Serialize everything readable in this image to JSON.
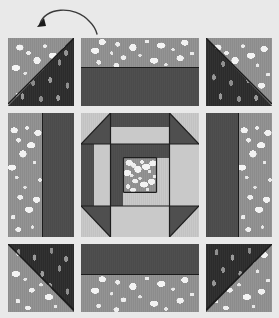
{
  "diagram": {
    "type": "quilt-block-layout",
    "grid": {
      "rows": 3,
      "cols": 3
    },
    "annotation": {
      "name": "rotation-arrow",
      "shape": "curved-arc-arrow",
      "direction": "counter-clockwise",
      "points_to": "top-left-unit"
    },
    "colors": {
      "background": "#e9e9e9",
      "speckled_gray": "#949494",
      "speckle_dots": "#f2f2f2",
      "dark_leaf_print": "#2b2b2b",
      "leaf_motif": "#949494",
      "solid_dark_gray": "#4f4f4f",
      "light_gray": "#c9c9c9",
      "seam_line": "#1e1e1e",
      "unit_border": "#8d8d8d"
    },
    "units": [
      {
        "name": "top-left-unit",
        "pattern": "half-square-triangle",
        "fabrics": [
          "speckled_gray",
          "dark_leaf_print"
        ],
        "dark_corner": "bottom-right"
      },
      {
        "name": "top-center-unit",
        "pattern": "two-band-horizontal",
        "fabrics": [
          "speckled_gray",
          "solid_dark_gray"
        ],
        "dark_band": "bottom"
      },
      {
        "name": "top-right-unit",
        "pattern": "half-square-triangle",
        "fabrics": [
          "speckled_gray",
          "dark_leaf_print"
        ],
        "dark_corner": "bottom-left"
      },
      {
        "name": "middle-left-unit",
        "pattern": "two-band-vertical",
        "fabrics": [
          "speckled_gray",
          "solid_dark_gray"
        ],
        "dark_band": "right"
      },
      {
        "name": "center-unit",
        "pattern": "churn-dash-octagon",
        "fabrics": [
          "light_gray",
          "solid_dark_gray",
          "speckled_gray"
        ],
        "dark_corner": "none"
      },
      {
        "name": "middle-right-unit",
        "pattern": "two-band-vertical",
        "fabrics": [
          "speckled_gray",
          "solid_dark_gray"
        ],
        "dark_band": "left"
      },
      {
        "name": "bottom-left-unit",
        "pattern": "half-square-triangle",
        "fabrics": [
          "speckled_gray",
          "dark_leaf_print"
        ],
        "dark_corner": "top-right"
      },
      {
        "name": "bottom-center-unit",
        "pattern": "two-band-horizontal",
        "fabrics": [
          "speckled_gray",
          "solid_dark_gray"
        ],
        "dark_band": "top"
      },
      {
        "name": "bottom-right-unit",
        "pattern": "half-square-triangle",
        "fabrics": [
          "speckled_gray",
          "dark_leaf_print"
        ],
        "dark_corner": "top-left"
      }
    ],
    "center_unit_parts": [
      {
        "name": "center-corner-top-left",
        "fabric": "light_gray"
      },
      {
        "name": "center-corner-top-right",
        "fabric": "light_gray"
      },
      {
        "name": "center-corner-bottom-left",
        "fabric": "light_gray"
      },
      {
        "name": "center-corner-bottom-right",
        "fabric": "light_gray"
      },
      {
        "name": "center-triangle-top-left",
        "fabric": "solid_dark_gray"
      },
      {
        "name": "center-triangle-top-right",
        "fabric": "solid_dark_gray"
      },
      {
        "name": "center-triangle-bottom-left",
        "fabric": "solid_dark_gray"
      },
      {
        "name": "center-triangle-bottom-right",
        "fabric": "solid_dark_gray"
      },
      {
        "name": "center-bar-top",
        "fabric": "solid_dark_gray"
      },
      {
        "name": "center-bar-bottom",
        "fabric": "solid_dark_gray"
      },
      {
        "name": "center-bar-left",
        "fabric": "solid_dark_gray"
      },
      {
        "name": "center-bar-right",
        "fabric": "solid_dark_gray"
      },
      {
        "name": "center-sash-top",
        "fabric": "light_gray"
      },
      {
        "name": "center-sash-bottom",
        "fabric": "light_gray"
      },
      {
        "name": "center-square",
        "fabric": "speckled_gray"
      }
    ]
  }
}
